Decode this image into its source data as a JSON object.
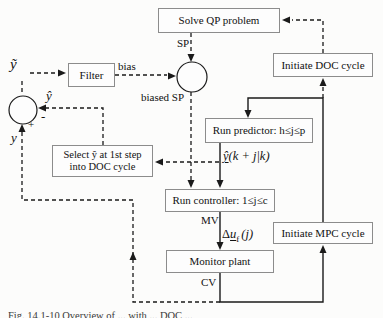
{
  "diagram": {
    "nodes": {
      "solve_qp": {
        "label": "Solve QP problem"
      },
      "initiate_doc": {
        "label": "Initiate DOC cycle"
      },
      "run_predictor": {
        "label": "Run predictor: h≤j≤p"
      },
      "select_yhat": {
        "line1": "Select ŷ at 1st step",
        "line2": "into DOC cycle"
      },
      "run_controller": {
        "label": "Run controller: 1≤j≤c"
      },
      "initiate_mpc": {
        "label": "Initiate MPC cycle"
      },
      "monitor_plant": {
        "label": "Monitor plant"
      },
      "filter": {
        "label": "Filter"
      }
    },
    "signals": {
      "sp": "SP",
      "bias": "bias",
      "biased_sp": "biased SP",
      "mv": "MV",
      "cv": "CV",
      "y_tilde": "ỹ",
      "y_hat": "ŷ",
      "y": "y",
      "plus": "+",
      "minus": "-",
      "pred_expr": {
        "base": "ŷ",
        "rest": "(k + j|k)"
      },
      "du_expr": {
        "delta": "Δ",
        "base": "u",
        "sub": "f",
        "rest": "(j)"
      }
    },
    "caption": "Fig. 14.1-10 Overview of ... with ... DOC ...",
    "colors": {
      "line": "#1a1a1a",
      "box_border": "#8c8c8c",
      "text": "#111111",
      "background": "#fcfcfb"
    }
  }
}
